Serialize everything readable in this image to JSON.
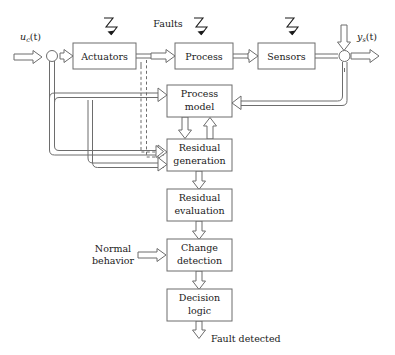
{
  "diagram": {
    "colors": {
      "stroke": "#6d6d6d",
      "text": "#1a1a1a",
      "background": "#ffffff",
      "bolt": "#1a1a1a"
    },
    "blocks": [
      {
        "id": "actuators",
        "label": "Actuators",
        "label2": "",
        "x": 73,
        "y": 43,
        "w": 63,
        "h": 26
      },
      {
        "id": "process",
        "label": "Process",
        "label2": "",
        "x": 175,
        "y": 43,
        "w": 58,
        "h": 26
      },
      {
        "id": "sensors",
        "label": "Sensors",
        "label2": "",
        "x": 258,
        "y": 43,
        "w": 57,
        "h": 26
      },
      {
        "id": "process-model",
        "label": "Process",
        "label2": "model",
        "x": 167,
        "y": 85,
        "w": 65,
        "h": 32
      },
      {
        "id": "residual-generation",
        "label": "Residual",
        "label2": "generation",
        "x": 167,
        "y": 139,
        "w": 65,
        "h": 32
      },
      {
        "id": "residual-evaluation",
        "label": "Residual",
        "label2": "evaluation",
        "x": 167,
        "y": 189,
        "w": 65,
        "h": 32
      },
      {
        "id": "change-detection",
        "label": "Change",
        "label2": "detection",
        "x": 167,
        "y": 239,
        "w": 65,
        "h": 32
      },
      {
        "id": "decision-logic",
        "label": "Decision",
        "label2": "logic",
        "x": 167,
        "y": 289,
        "w": 65,
        "h": 32
      }
    ],
    "labels": {
      "faults": "Faults",
      "normal_behavior_line1": "Normal",
      "normal_behavior_line2": "behavior",
      "fault_detected": "Fault detected",
      "input_signal_base": "u",
      "input_signal_sub": "c",
      "input_signal_arg": "(t)",
      "output_signal_base": "y",
      "output_signal_sub": "s",
      "output_signal_arg": "(t)"
    },
    "fault_injection_points": [
      {
        "id": "fault-actuators",
        "target": "actuators"
      },
      {
        "id": "fault-process",
        "target": "process"
      },
      {
        "id": "fault-sensors",
        "target": "sensors"
      }
    ],
    "signal_flow": [
      "u_c(t) -> summing junction -> Actuators",
      "Actuators -> Process",
      "Process -> Sensors",
      "Sensors -> output junction -> y_s(t)",
      "Actuators output (dashed) -> Residual generation",
      "Input feedback -> Process model",
      "Input feedback -> Residual generation",
      "Sensors output feedback -> Process model",
      "Sensors output feedback -> Residual generation",
      "Process model -> Residual generation",
      "Residual generation -> Process model",
      "Residual generation -> Residual evaluation",
      "Residual evaluation -> Change detection",
      "Normal behavior -> Change detection",
      "Change detection -> Decision logic",
      "Decision logic -> Fault detected"
    ]
  }
}
